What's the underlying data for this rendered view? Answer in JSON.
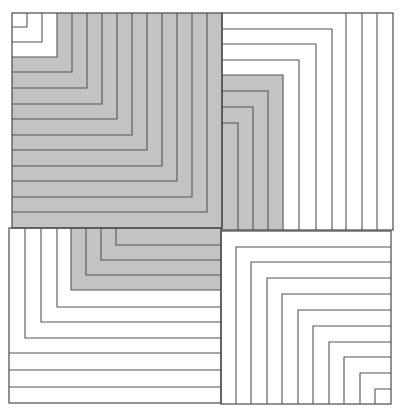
{
  "diagram": {
    "colors": {
      "background": "#ffffff",
      "shade": "#c3c3c3",
      "line": "#555555"
    },
    "quadrants": {
      "top_left": {
        "bounds": [
          12,
          13,
          222,
          228
        ],
        "orientation": "corners toward bottom-right, arms to left and top edges",
        "corners": [
          [
            27,
            27
          ],
          [
            42,
            42
          ],
          [
            57,
            57
          ],
          [
            72,
            72
          ],
          [
            87,
            88
          ],
          [
            102,
            104
          ],
          [
            117,
            119
          ],
          [
            132,
            135
          ],
          [
            147,
            150
          ],
          [
            162,
            166
          ],
          [
            177,
            181
          ],
          [
            192,
            197
          ],
          [
            207,
            212
          ]
        ],
        "shaded_from_corner_index": 3
      },
      "top_right": {
        "bounds": [
          222,
          13,
          393,
          230
        ],
        "orientation": "corners toward bottom-left, arms to left and bottom edges",
        "corners": [
          [
            332,
            29
          ],
          [
            316,
            44
          ],
          [
            299,
            60
          ],
          [
            283,
            75
          ],
          [
            268,
            91
          ],
          [
            253,
            107
          ],
          [
            238,
            123
          ]
        ],
        "vertical_lines_x": [
          346,
          362,
          377
        ],
        "shaded_region": [
          222,
          75,
          283,
          230
        ]
      },
      "bottom_left": {
        "bounds": [
          9,
          228,
          221,
          403
        ],
        "orientation": "corners toward top-right, arms to top and right edges",
        "corners": [
          [
            25,
            338
          ],
          [
            41,
            322
          ],
          [
            57,
            307
          ],
          [
            71,
            290
          ],
          [
            86,
            275
          ],
          [
            101,
            260
          ],
          [
            116,
            245
          ]
        ],
        "horizontal_lines_y": [
          353,
          370,
          387
        ],
        "shaded_region": [
          71,
          228,
          221,
          290
        ]
      },
      "bottom_right": {
        "bounds": [
          221,
          231,
          391,
          404
        ],
        "orientation": "corners toward top-left, arms to right and bottom edges",
        "corners": [
          [
            236,
            247
          ],
          [
            251,
            262
          ],
          [
            267,
            278
          ],
          [
            282,
            294
          ],
          [
            298,
            310
          ],
          [
            313,
            326
          ],
          [
            329,
            342
          ],
          [
            344,
            357
          ],
          [
            360,
            373
          ],
          [
            375,
            389
          ]
        ]
      }
    }
  }
}
